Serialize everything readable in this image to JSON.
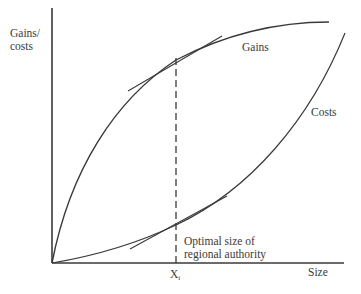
{
  "diagram": {
    "y_axis_label_line1": "Gains/",
    "y_axis_label_line2": "costs",
    "x_axis_label": "Size",
    "curves": [
      {
        "name": "Gains",
        "label": "Gains",
        "shape": "concave, increasing"
      },
      {
        "name": "Costs",
        "label": "Costs",
        "shape": "convex, increasing"
      }
    ],
    "marker": {
      "label_main": "X",
      "label_sub": "i",
      "annotation_line1": "Optimal size of",
      "annotation_line2": "regional authority"
    },
    "colors": {
      "line": "#3a3a3a",
      "background": "#ffffff"
    }
  }
}
